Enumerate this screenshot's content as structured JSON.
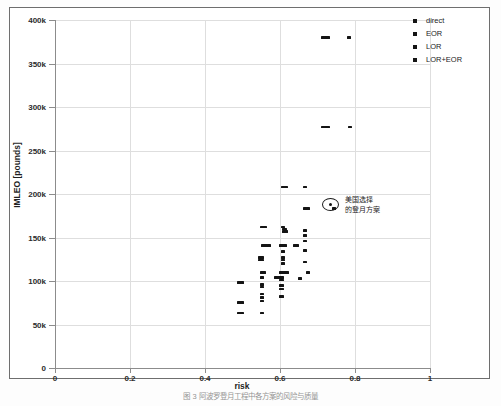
{
  "figure": {
    "caption": "图 3    阿波罗登月工程中各方案的风险与质量",
    "background": "#ffffff",
    "frame_color": "#6e6e6e"
  },
  "annotation": {
    "line1": "美国选择",
    "line2": "的登月方案",
    "marker_name": "highlighted-selected-option",
    "point": {
      "x": 0.745,
      "y": 183000
    }
  },
  "chart_data": {
    "type": "scatter",
    "title": "",
    "xlabel": "risk",
    "ylabel": "IMLEO [pounds]",
    "xlim": [
      0,
      1
    ],
    "ylim": [
      0,
      400000
    ],
    "xticks": [
      0,
      0.2,
      0.4,
      0.6,
      0.8,
      1
    ],
    "xtick_labels": [
      "0",
      "0.2",
      "0.4",
      "0.6",
      "0.8",
      "1"
    ],
    "yticks": [
      0,
      50000,
      100000,
      150000,
      200000,
      250000,
      300000,
      350000,
      400000
    ],
    "ytick_labels": [
      "0",
      "50k",
      "100k",
      "150k",
      "200k",
      "250k",
      "300k",
      "350k",
      "400k"
    ],
    "grid": true,
    "legend_position": "top-right",
    "marker_color": "#141414",
    "series": [
      {
        "name": "direct",
        "marker": "square",
        "color": "#141414"
      },
      {
        "name": "EOR",
        "marker": "square",
        "color": "#141414"
      },
      {
        "name": "LOR",
        "marker": "square",
        "color": "#141414"
      },
      {
        "name": "LOR+EOR",
        "marker": "square",
        "color": "#141414"
      }
    ],
    "points": [
      {
        "x": 0.715,
        "y": 380000,
        "s": "direct"
      },
      {
        "x": 0.722,
        "y": 380000,
        "s": "direct"
      },
      {
        "x": 0.729,
        "y": 380000,
        "s": "direct"
      },
      {
        "x": 0.785,
        "y": 380000,
        "s": "EOR"
      },
      {
        "x": 0.715,
        "y": 277000,
        "s": "direct"
      },
      {
        "x": 0.722,
        "y": 277000,
        "s": "direct"
      },
      {
        "x": 0.729,
        "y": 277000,
        "s": "direct"
      },
      {
        "x": 0.786,
        "y": 277000,
        "s": "EOR"
      },
      {
        "x": 0.608,
        "y": 208000,
        "s": "LOR"
      },
      {
        "x": 0.616,
        "y": 208000,
        "s": "LOR"
      },
      {
        "x": 0.666,
        "y": 208000,
        "s": "LOR+EOR"
      },
      {
        "x": 0.667,
        "y": 183000,
        "s": "LOR+EOR"
      },
      {
        "x": 0.674,
        "y": 183000,
        "s": "LOR+EOR"
      },
      {
        "x": 0.745,
        "y": 183000,
        "s": "LOR+EOR"
      },
      {
        "x": 0.553,
        "y": 162000,
        "s": "LOR"
      },
      {
        "x": 0.56,
        "y": 162000,
        "s": "LOR"
      },
      {
        "x": 0.607,
        "y": 162000,
        "s": "LOR"
      },
      {
        "x": 0.612,
        "y": 160000,
        "s": "LOR"
      },
      {
        "x": 0.61,
        "y": 157000,
        "s": "LOR"
      },
      {
        "x": 0.616,
        "y": 157000,
        "s": "LOR"
      },
      {
        "x": 0.666,
        "y": 158000,
        "s": "LOR+EOR"
      },
      {
        "x": 0.666,
        "y": 152000,
        "s": "LOR+EOR"
      },
      {
        "x": 0.666,
        "y": 146000,
        "s": "LOR+EOR"
      },
      {
        "x": 0.556,
        "y": 141000,
        "s": "LOR"
      },
      {
        "x": 0.563,
        "y": 141000,
        "s": "LOR"
      },
      {
        "x": 0.57,
        "y": 141000,
        "s": "LOR"
      },
      {
        "x": 0.604,
        "y": 141000,
        "s": "LOR"
      },
      {
        "x": 0.612,
        "y": 141000,
        "s": "LOR"
      },
      {
        "x": 0.639,
        "y": 141000,
        "s": "LOR+EOR"
      },
      {
        "x": 0.646,
        "y": 141000,
        "s": "LOR+EOR"
      },
      {
        "x": 0.608,
        "y": 134000,
        "s": "LOR"
      },
      {
        "x": 0.666,
        "y": 135000,
        "s": "LOR+EOR"
      },
      {
        "x": 0.547,
        "y": 127000,
        "s": "LOR"
      },
      {
        "x": 0.553,
        "y": 127000,
        "s": "LOR"
      },
      {
        "x": 0.547,
        "y": 124000,
        "s": "LOR"
      },
      {
        "x": 0.553,
        "y": 124000,
        "s": "LOR"
      },
      {
        "x": 0.607,
        "y": 127000,
        "s": "LOR"
      },
      {
        "x": 0.607,
        "y": 124000,
        "s": "LOR"
      },
      {
        "x": 0.607,
        "y": 120000,
        "s": "LOR"
      },
      {
        "x": 0.666,
        "y": 122000,
        "s": "LOR+EOR"
      },
      {
        "x": 0.551,
        "y": 110000,
        "s": "LOR"
      },
      {
        "x": 0.558,
        "y": 110000,
        "s": "LOR"
      },
      {
        "x": 0.604,
        "y": 110000,
        "s": "LOR"
      },
      {
        "x": 0.612,
        "y": 110000,
        "s": "LOR"
      },
      {
        "x": 0.619,
        "y": 110000,
        "s": "LOR"
      },
      {
        "x": 0.674,
        "y": 110000,
        "s": "LOR+EOR"
      },
      {
        "x": 0.552,
        "y": 104000,
        "s": "LOR"
      },
      {
        "x": 0.59,
        "y": 104000,
        "s": "LOR"
      },
      {
        "x": 0.597,
        "y": 104000,
        "s": "LOR"
      },
      {
        "x": 0.604,
        "y": 104000,
        "s": "LOR"
      },
      {
        "x": 0.604,
        "y": 101000,
        "s": "LOR"
      },
      {
        "x": 0.653,
        "y": 103000,
        "s": "LOR+EOR"
      },
      {
        "x": 0.491,
        "y": 98000,
        "s": "direct"
      },
      {
        "x": 0.498,
        "y": 98000,
        "s": "direct"
      },
      {
        "x": 0.551,
        "y": 96000,
        "s": "LOR"
      },
      {
        "x": 0.551,
        "y": 93000,
        "s": "LOR"
      },
      {
        "x": 0.604,
        "y": 95000,
        "s": "LOR"
      },
      {
        "x": 0.604,
        "y": 91000,
        "s": "LOR"
      },
      {
        "x": 0.551,
        "y": 85000,
        "s": "LOR"
      },
      {
        "x": 0.551,
        "y": 81000,
        "s": "LOR"
      },
      {
        "x": 0.604,
        "y": 82000,
        "s": "LOR"
      },
      {
        "x": 0.551,
        "y": 77000,
        "s": "LOR"
      },
      {
        "x": 0.491,
        "y": 75000,
        "s": "direct"
      },
      {
        "x": 0.498,
        "y": 75000,
        "s": "direct"
      },
      {
        "x": 0.491,
        "y": 63000,
        "s": "direct"
      },
      {
        "x": 0.498,
        "y": 63000,
        "s": "direct"
      },
      {
        "x": 0.551,
        "y": 63000,
        "s": "LOR"
      }
    ]
  }
}
